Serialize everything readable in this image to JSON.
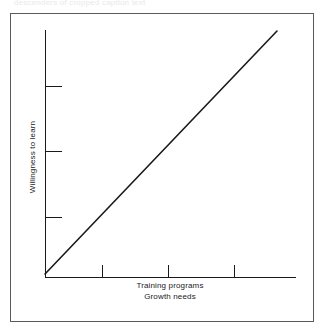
{
  "figure": {
    "background_color": "#ffffff",
    "frame_color": "#5a5a5a",
    "ink_color": "#1a1a1a",
    "caption_remnant": "descenders of cropped caption text"
  },
  "axes": {
    "ylabel": "Willingness to learn",
    "xlabel_line1": "Training programs",
    "xlabel_line2": "Growth needs"
  },
  "chart_data": {
    "type": "line",
    "title": "",
    "subtitle": "",
    "xlabel": "Training programs / Growth needs",
    "ylabel": "Willingness to learn",
    "grid": false,
    "legend": "none",
    "annotations": [],
    "axis_style": {
      "spines": [
        "left",
        "bottom"
      ],
      "tick_direction": "in",
      "tick_labels": false,
      "arrowheads": false
    },
    "xlim": [
      0,
      1
    ],
    "ylim": [
      0,
      1
    ],
    "x_ticks": [
      0.227,
      0.49,
      0.753
    ],
    "y_ticks": [
      0.227,
      0.51,
      0.773
    ],
    "x_tick_labels": [
      "",
      "",
      ""
    ],
    "y_tick_labels": [
      "",
      "",
      ""
    ],
    "series": [
      {
        "name": "Willingness to learn vs. growth needs",
        "kind": "line",
        "color": "#1a1a1a",
        "linewidth": 1.6,
        "relationship": "positive linear",
        "x": [
          0.0,
          1.0
        ],
        "y": [
          0.012,
          0.99
        ]
      }
    ]
  },
  "geometry": {
    "plot_origin_x": 45,
    "plot_origin_y": 277,
    "y_axis_top": 30,
    "x_axis_right": 296,
    "y_tick_pixels": [
      86,
      151,
      217
    ],
    "x_tick_pixels": [
      102,
      168,
      234
    ],
    "line_start": [
      45,
      274
    ],
    "line_end": [
      277,
      31
    ]
  }
}
